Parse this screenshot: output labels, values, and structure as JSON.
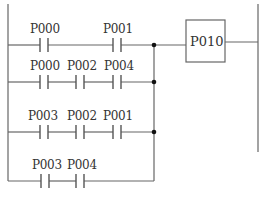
{
  "diagram": {
    "type": "ladder",
    "output_coil": {
      "label": "P010"
    },
    "rungs": [
      {
        "contacts": [
          "P000",
          "P001"
        ]
      },
      {
        "contacts": [
          "P000",
          "P002",
          "P004"
        ]
      },
      {
        "contacts": [
          "P003",
          "P002",
          "P001"
        ]
      },
      {
        "contacts": [
          "P003",
          "P004"
        ]
      }
    ]
  }
}
